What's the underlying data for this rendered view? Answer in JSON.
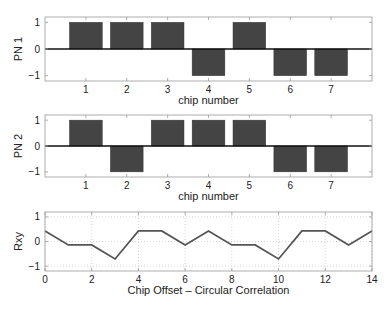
{
  "chart_data": [
    {
      "type": "bar",
      "title": "",
      "xlabel": "chip number",
      "ylabel": "PN 1",
      "categories": [
        "1",
        "2",
        "3",
        "4",
        "5",
        "6",
        "7"
      ],
      "values": [
        1,
        1,
        1,
        -1,
        1,
        -1,
        -1
      ],
      "xlim": [
        0,
        8
      ],
      "ylim": [
        -1.2,
        1.2
      ],
      "yticks": [
        "-1",
        "0",
        "1"
      ],
      "grid": false,
      "bar_color": "#444444"
    },
    {
      "type": "bar",
      "title": "",
      "xlabel": "chip number",
      "ylabel": "PN 2",
      "categories": [
        "1",
        "2",
        "3",
        "4",
        "5",
        "6",
        "7"
      ],
      "values": [
        1,
        -1,
        1,
        1,
        1,
        -1,
        -1
      ],
      "xlim": [
        0,
        8
      ],
      "ylim": [
        -1.2,
        1.2
      ],
      "yticks": [
        "-1",
        "0",
        "1"
      ],
      "grid": false,
      "bar_color": "#444444"
    },
    {
      "type": "line",
      "title": "",
      "xlabel": "Chip Offset – Circular Correlation",
      "ylabel": "Rxy",
      "x": [
        0,
        1,
        2,
        3,
        4,
        5,
        6,
        7,
        8,
        9,
        10,
        11,
        12,
        13,
        14
      ],
      "values": [
        0.43,
        -0.14,
        -0.14,
        -0.71,
        0.43,
        0.43,
        -0.14,
        0.43,
        -0.14,
        -0.14,
        -0.71,
        0.43,
        0.43,
        -0.14,
        0.43
      ],
      "xlim": [
        0,
        14
      ],
      "ylim": [
        -1.2,
        1.2
      ],
      "xticks": [
        "0",
        "2",
        "4",
        "6",
        "8",
        "10",
        "12",
        "14"
      ],
      "yticks": [
        "-1",
        "0",
        "1"
      ],
      "grid": true,
      "line_color": "#555555"
    }
  ]
}
